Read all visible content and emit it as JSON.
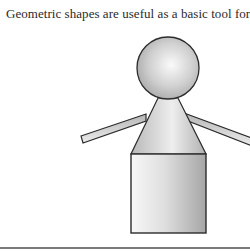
{
  "caption": {
    "text": "Geometric shapes are useful as a basic tool for sha"
  },
  "figure": {
    "shapes": [
      {
        "name": "head",
        "type": "circle",
        "cx": 168,
        "cy": 68,
        "r": 31
      },
      {
        "name": "body-triangle",
        "type": "triangle",
        "points": "158,98 178,98 206,154 131,154"
      },
      {
        "name": "lower-body",
        "type": "rectangle",
        "x": 131,
        "y": 154,
        "width": 75,
        "height": 79
      },
      {
        "name": "left-arm",
        "type": "bar",
        "points": "81,136 146,114 146,121 83,143"
      },
      {
        "name": "right-arm",
        "type": "bar",
        "points": "184,113 252,138 252,146 188,121"
      }
    ],
    "colors": {
      "stroke": "#2b2b2b",
      "fill_light": "#f4f4f4",
      "fill_dark": "#a8a8a8",
      "rule": "#7a7a7a"
    }
  }
}
